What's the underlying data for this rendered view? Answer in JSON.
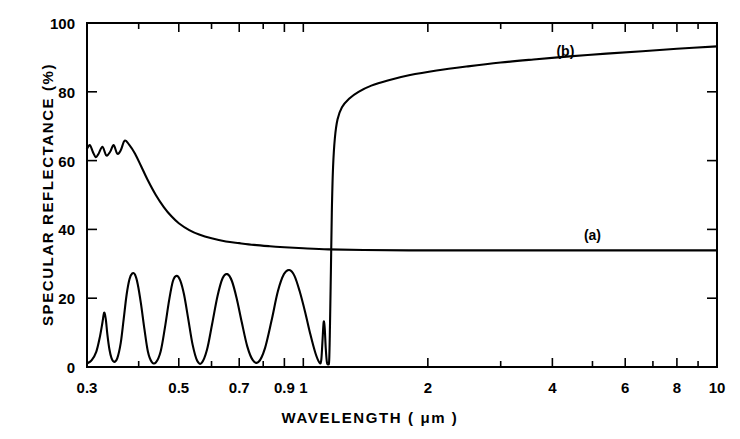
{
  "figure": {
    "xlabel": "WAVELENGTH ( μm )",
    "ylabel": "SPECULAR REFLECTANCE (%)",
    "background_color": "#ffffff",
    "line_color": "#000000"
  },
  "chart_data": {
    "type": "line",
    "title": "",
    "xlabel": "WAVELENGTH ( μm )",
    "ylabel": "SPECULAR REFLECTANCE (%)",
    "xscale": "log",
    "yscale": "linear",
    "xlim": [
      0.3,
      10
    ],
    "ylim": [
      0,
      100
    ],
    "grid": false,
    "legend": "inline-annotations",
    "xticks": [
      0.3,
      0.4,
      0.5,
      0.6,
      0.7,
      0.8,
      0.9,
      1,
      2,
      3,
      4,
      5,
      6,
      7,
      8,
      9,
      10
    ],
    "xtick_labels": [
      {
        "value": 0.3,
        "label": "0.3"
      },
      {
        "value": 0.5,
        "label": "0.5"
      },
      {
        "value": 0.7,
        "label": "0.7"
      },
      {
        "value": 0.9,
        "label": "0.9"
      },
      {
        "value": 1,
        "label": "1"
      },
      {
        "value": 2,
        "label": "2"
      },
      {
        "value": 4,
        "label": "4"
      },
      {
        "value": 6,
        "label": "6"
      },
      {
        "value": 8,
        "label": "8"
      },
      {
        "value": 10,
        "label": "10"
      }
    ],
    "yticks": [
      0,
      20,
      40,
      60,
      80,
      100
    ],
    "ytick_labels": [
      "0",
      "20",
      "40",
      "60",
      "80",
      "100"
    ],
    "annotations": [
      {
        "text": "(a)",
        "x": 5.0,
        "y": 38.5
      },
      {
        "text": "(b)",
        "x": 4.3,
        "y": 92.0
      }
    ],
    "series": [
      {
        "name": "(a)",
        "label": "(a)",
        "description": "Decaying reflectance curve with UV interference ripples settling to a constant 34% plateau",
        "points": [
          [
            0.3,
            63.5
          ],
          [
            0.305,
            64.5
          ],
          [
            0.31,
            62.5
          ],
          [
            0.315,
            61.0
          ],
          [
            0.32,
            62.0
          ],
          [
            0.327,
            64.0
          ],
          [
            0.334,
            61.5
          ],
          [
            0.341,
            62.5
          ],
          [
            0.348,
            64.5
          ],
          [
            0.355,
            62.0
          ],
          [
            0.362,
            63.0
          ],
          [
            0.37,
            65.8
          ],
          [
            0.38,
            64.5
          ],
          [
            0.392,
            62.0
          ],
          [
            0.405,
            58.5
          ],
          [
            0.42,
            54.5
          ],
          [
            0.44,
            50.0
          ],
          [
            0.46,
            46.5
          ],
          [
            0.48,
            43.8
          ],
          [
            0.5,
            41.8
          ],
          [
            0.53,
            39.8
          ],
          [
            0.56,
            38.5
          ],
          [
            0.6,
            37.4
          ],
          [
            0.65,
            36.5
          ],
          [
            0.7,
            36.0
          ],
          [
            0.76,
            35.5
          ],
          [
            0.83,
            35.1
          ],
          [
            0.9,
            34.8
          ],
          [
            1.0,
            34.5
          ],
          [
            1.15,
            34.2
          ],
          [
            1.4,
            34.0
          ],
          [
            1.8,
            33.9
          ],
          [
            2.5,
            33.9
          ],
          [
            4.0,
            33.9
          ],
          [
            6.0,
            33.9
          ],
          [
            8.0,
            33.9
          ],
          [
            10.0,
            33.9
          ]
        ]
      },
      {
        "name": "(b)",
        "label": "(b)",
        "description": "Thin-film interference fringes below 1.2 um, then sharp rise to high infrared reflectance",
        "points": [
          [
            0.3,
            1.0
          ],
          [
            0.308,
            2.0
          ],
          [
            0.316,
            4.5
          ],
          [
            0.322,
            8.5
          ],
          [
            0.327,
            13.0
          ],
          [
            0.33,
            15.8
          ],
          [
            0.333,
            14.0
          ],
          [
            0.336,
            9.5
          ],
          [
            0.34,
            5.0
          ],
          [
            0.344,
            2.5
          ],
          [
            0.349,
            1.5
          ],
          [
            0.355,
            2.5
          ],
          [
            0.362,
            7.0
          ],
          [
            0.368,
            14.0
          ],
          [
            0.374,
            21.0
          ],
          [
            0.38,
            25.5
          ],
          [
            0.386,
            27.2
          ],
          [
            0.392,
            26.8
          ],
          [
            0.398,
            24.0
          ],
          [
            0.405,
            18.5
          ],
          [
            0.413,
            11.0
          ],
          [
            0.421,
            4.5
          ],
          [
            0.43,
            1.5
          ],
          [
            0.44,
            1.3
          ],
          [
            0.452,
            4.5
          ],
          [
            0.463,
            11.5
          ],
          [
            0.474,
            19.5
          ],
          [
            0.484,
            25.0
          ],
          [
            0.494,
            26.5
          ],
          [
            0.504,
            25.2
          ],
          [
            0.515,
            21.0
          ],
          [
            0.527,
            14.0
          ],
          [
            0.54,
            6.5
          ],
          [
            0.554,
            1.8
          ],
          [
            0.568,
            1.2
          ],
          [
            0.585,
            5.0
          ],
          [
            0.602,
            12.5
          ],
          [
            0.62,
            20.5
          ],
          [
            0.638,
            25.8
          ],
          [
            0.655,
            27.0
          ],
          [
            0.672,
            25.0
          ],
          [
            0.69,
            20.0
          ],
          [
            0.71,
            13.0
          ],
          [
            0.732,
            6.0
          ],
          [
            0.755,
            2.0
          ],
          [
            0.78,
            1.5
          ],
          [
            0.808,
            5.5
          ],
          [
            0.838,
            13.5
          ],
          [
            0.868,
            22.0
          ],
          [
            0.898,
            27.0
          ],
          [
            0.925,
            28.2
          ],
          [
            0.952,
            26.5
          ],
          [
            0.98,
            22.0
          ],
          [
            1.01,
            16.0
          ],
          [
            1.04,
            9.5
          ],
          [
            1.07,
            4.0
          ],
          [
            1.095,
            1.2
          ],
          [
            1.105,
            2.0
          ],
          [
            1.112,
            7.0
          ],
          [
            1.118,
            12.0
          ],
          [
            1.122,
            13.2
          ],
          [
            1.127,
            11.0
          ],
          [
            1.133,
            5.5
          ],
          [
            1.14,
            1.5
          ],
          [
            1.148,
            0.8
          ],
          [
            1.155,
            2.0
          ],
          [
            1.16,
            12.0
          ],
          [
            1.166,
            28.0
          ],
          [
            1.172,
            45.0
          ],
          [
            1.18,
            58.0
          ],
          [
            1.192,
            66.5
          ],
          [
            1.21,
            72.0
          ],
          [
            1.24,
            75.5
          ],
          [
            1.29,
            78.0
          ],
          [
            1.36,
            80.0
          ],
          [
            1.46,
            81.8
          ],
          [
            1.6,
            83.3
          ],
          [
            1.8,
            84.8
          ],
          [
            2.1,
            86.2
          ],
          [
            2.5,
            87.4
          ],
          [
            3.0,
            88.5
          ],
          [
            3.6,
            89.4
          ],
          [
            4.4,
            90.3
          ],
          [
            5.4,
            91.1
          ],
          [
            6.6,
            91.8
          ],
          [
            8.0,
            92.5
          ],
          [
            10.0,
            93.2
          ]
        ]
      }
    ]
  }
}
